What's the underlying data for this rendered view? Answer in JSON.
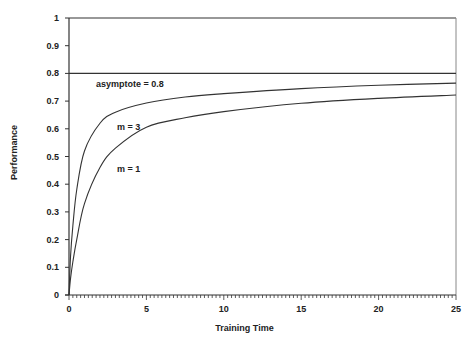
{
  "chart_data": {
    "type": "line",
    "title": "",
    "xlabel": "Training Time",
    "ylabel": "Performance",
    "xlim": [
      0,
      25
    ],
    "ylim": [
      0,
      1
    ],
    "x_ticks": [
      0,
      5,
      10,
      15,
      20,
      25
    ],
    "x_minor_tick_step": 0.25,
    "y_ticks": [
      0,
      0.1,
      0.2,
      0.3,
      0.4,
      0.5,
      0.6,
      0.7,
      0.8,
      0.9,
      1
    ],
    "x_tick_labels": [
      "0",
      "5",
      "10",
      "15",
      "20",
      "25"
    ],
    "y_tick_labels": [
      "0",
      "0.1",
      "0.2",
      "0.3",
      "0.4",
      "0.5",
      "0.6",
      "0.7",
      "0.8",
      "0.9",
      "1"
    ],
    "grid": false,
    "legend": "none",
    "asymptote": {
      "value": 0.8,
      "label": "asymptote = 0.8"
    },
    "series": [
      {
        "name": "m = 3",
        "label": "m = 3",
        "x": [
          0,
          0.1,
          0.25,
          0.5,
          1,
          2,
          3,
          5,
          7.5,
          10,
          15,
          20,
          25
        ],
        "values": [
          0,
          0.14,
          0.25,
          0.38,
          0.52,
          0.62,
          0.66,
          0.693,
          0.715,
          0.727,
          0.745,
          0.757,
          0.765
        ]
      },
      {
        "name": "m = 1",
        "label": "m = 1",
        "x": [
          0,
          0.1,
          0.25,
          0.5,
          1,
          2,
          3,
          5,
          7.5,
          10,
          15,
          20,
          25
        ],
        "values": [
          0,
          0.06,
          0.12,
          0.2,
          0.33,
          0.46,
          0.53,
          0.606,
          0.64,
          0.662,
          0.692,
          0.71,
          0.722
        ]
      }
    ]
  }
}
